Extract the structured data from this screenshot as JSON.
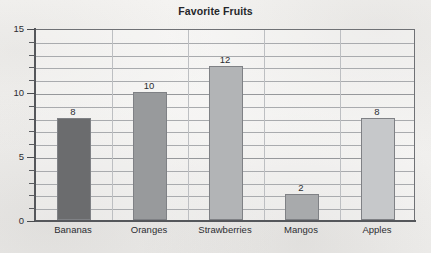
{
  "chart_data": {
    "type": "bar",
    "title": "Favorite Fruits",
    "xlabel": "",
    "ylabel": "",
    "categories": [
      "Bananas",
      "Oranges",
      "Strawberries",
      "Mangos",
      "Apples"
    ],
    "values": [
      8,
      10,
      12,
      2,
      8
    ],
    "data_labels": [
      "8",
      "10",
      "12",
      "2",
      "8"
    ],
    "ylim": [
      0,
      15
    ],
    "ytick_labels": [
      "0",
      "5",
      "10",
      "15"
    ],
    "ytick_values": [
      0,
      5,
      10,
      15
    ],
    "ytick_minor_step": 1,
    "grid": "horizontal",
    "legend": "none",
    "bar_colors": [
      "#6b6c6e",
      "#989a9c",
      "#b2b4b6",
      "#a8aaac",
      "#c6c8ca"
    ],
    "axis_color": "#55575b",
    "gridline_color": "#a9abae",
    "text_color": "#2c2d31"
  },
  "axis": {
    "y_labels": [
      "15",
      "10",
      "5",
      "0"
    ]
  }
}
